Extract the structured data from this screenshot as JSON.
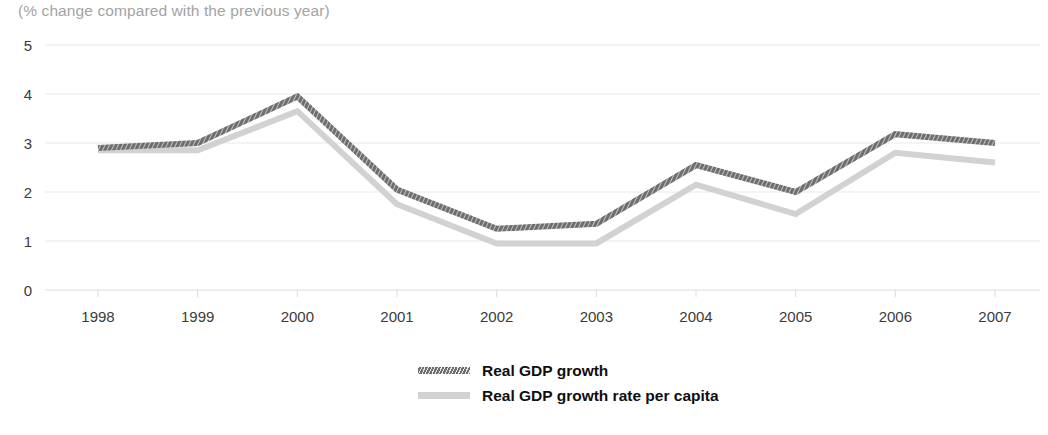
{
  "chart_data": {
    "type": "line",
    "title": "",
    "subtitle": "(% change compared with the previous year)",
    "xlabel": "",
    "ylabel": "",
    "categories": [
      "1998",
      "1999",
      "2000",
      "2001",
      "2002",
      "2003",
      "2004",
      "2005",
      "2006",
      "2007"
    ],
    "x": [
      1998,
      1999,
      2000,
      2001,
      2002,
      2003,
      2004,
      2005,
      2006,
      2007
    ],
    "series": [
      {
        "name": "Real GDP growth",
        "color": "#6e6e6e",
        "style": "hatched",
        "values": [
          2.9,
          3.0,
          3.95,
          2.05,
          1.25,
          1.35,
          2.55,
          2.0,
          3.18,
          3.0
        ]
      },
      {
        "name": "Real GDP growth rate per capita",
        "color": "#d2d2d2",
        "style": "solid",
        "values": [
          2.85,
          2.85,
          3.65,
          1.75,
          0.95,
          0.95,
          2.15,
          1.55,
          2.8,
          2.6
        ]
      }
    ],
    "ylim": [
      0,
      5
    ],
    "yticks": [
      0,
      1,
      2,
      3,
      4,
      5
    ],
    "ytick_labels": [
      "0",
      "1",
      "2",
      "3",
      "4",
      "5"
    ],
    "grid": true,
    "grid_color": "#e9e9e9",
    "legend_position": "bottom-center",
    "background": "#ffffff"
  },
  "legend": {
    "items": [
      {
        "label": "Real GDP growth"
      },
      {
        "label": "Real GDP growth rate per capita"
      }
    ]
  }
}
